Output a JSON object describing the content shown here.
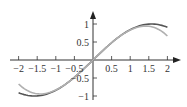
{
  "chart_data": {
    "type": "line",
    "title": "",
    "xlabel": "",
    "ylabel": "",
    "xlim": [
      -2,
      2
    ],
    "ylim": [
      -1,
      1
    ],
    "grid": false,
    "legend": null,
    "x_ticks": [
      "-2",
      "-1.5",
      "-1",
      "-0.5",
      "0.5",
      "1",
      "1.5",
      "2"
    ],
    "y_ticks": [
      "1",
      "0.5",
      "-0.5",
      "-1"
    ],
    "x_tick_values": [
      -2,
      -1.5,
      -1,
      -0.5,
      0.5,
      1,
      1.5,
      2
    ],
    "y_tick_values": [
      1,
      0.5,
      -0.5,
      -1
    ],
    "series": [
      {
        "name": "sin x",
        "color": "#555555",
        "x": [
          -2,
          -1.5,
          -1,
          -0.5,
          0,
          0.5,
          1,
          1.5,
          2
        ],
        "values": [
          -0.909,
          -0.997,
          -0.841,
          -0.479,
          0,
          0.479,
          0.841,
          0.997,
          0.909
        ]
      },
      {
        "name": "x - x^3/6",
        "color": "#b0b0b0",
        "x": [
          -2,
          -1.5,
          -1,
          -0.5,
          0,
          0.5,
          1,
          1.5,
          2
        ],
        "values": [
          -0.667,
          -0.938,
          -0.833,
          -0.479,
          0,
          0.479,
          0.833,
          0.938,
          0.667
        ]
      }
    ]
  }
}
